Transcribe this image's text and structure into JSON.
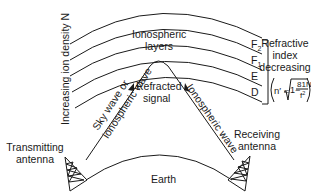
{
  "diagram": {
    "axis_label": "Increasing ion density N",
    "ionosphere_label_line1": "Ionospheric",
    "ionosphere_label_line2": "layers",
    "layers": [
      {
        "name": "F",
        "sub": "2"
      },
      {
        "name": "F",
        "sub": "1"
      },
      {
        "name": "E",
        "sub": ""
      },
      {
        "name": "D",
        "sub": ""
      }
    ],
    "refractive_label_line1": "Refractive",
    "refractive_label_line2": "index",
    "refractive_label_line3": "decreasing",
    "formula": {
      "lhs": "n′ =",
      "radicand_lead": "1−",
      "numerator": "81N",
      "denominator": "f",
      "denominator_exp": "2"
    },
    "up_wave_line1": "Sky wave or",
    "up_wave_line2": "ionospheric wave",
    "refracted_line1": "Refracted",
    "refracted_line2": "signal",
    "down_wave": "Ionospheric wave",
    "transmitter_line1": "Transmitting",
    "transmitter_line2": "antenna",
    "receiver_line1": "Receiving",
    "receiver_line2": "antenna",
    "earth": "Earth",
    "colors": {
      "ink": "#1a1a1a",
      "background": "#ffffff"
    }
  }
}
